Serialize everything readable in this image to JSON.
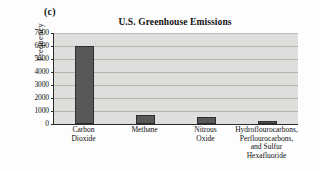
{
  "panel": {
    "label": "(c)"
  },
  "chart_data": {
    "type": "bar",
    "title": "U.S. Greenhouse Emissions",
    "xlabel": "",
    "ylabel": "Frequency",
    "categories": [
      "Carbon\nDioxide",
      "Methane",
      "Nitrous\nOxide",
      "Hydroflourocarbons,\nPerflourocarbons,\nand Sulfur\nHexafluoride"
    ],
    "values": [
      6000,
      700,
      550,
      250
    ],
    "ylim": [
      0,
      7000
    ],
    "yticks": [
      0,
      1000,
      2000,
      3000,
      4000,
      5000,
      6000,
      7000
    ],
    "ytick_labels": [
      "0",
      "1000",
      "2000",
      "3000",
      "4000",
      "5000",
      "6000",
      "7000"
    ],
    "grid": true,
    "legend": false,
    "bar_color": "#585858",
    "plot_background": "#dededc",
    "axis_color": "#2b2b2b",
    "gridline_color": "#b4b4b0"
  }
}
